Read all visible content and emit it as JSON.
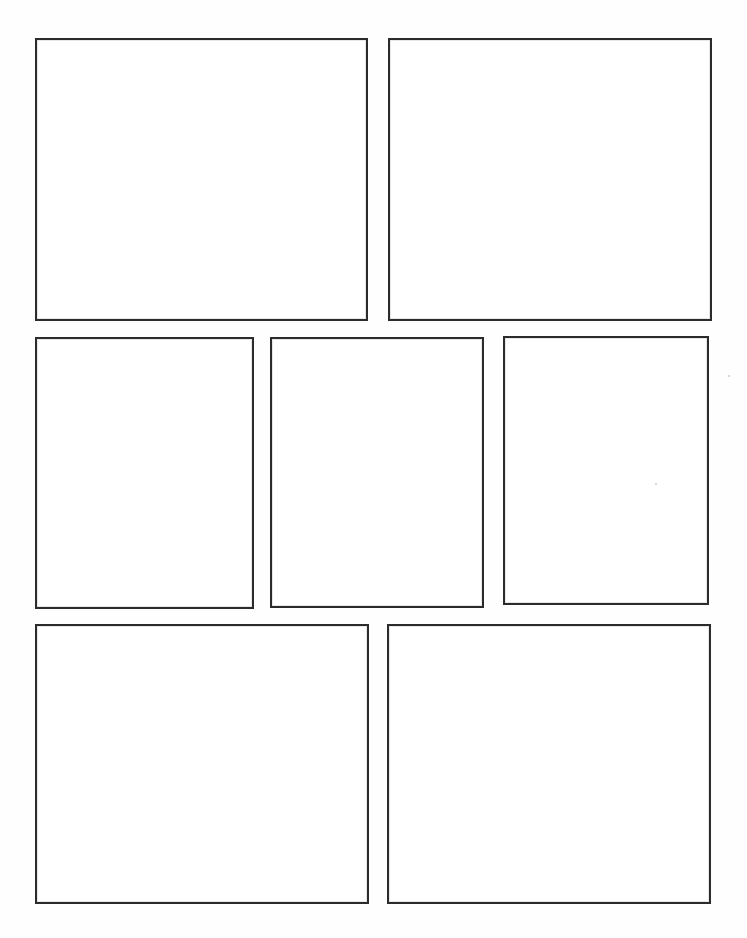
{
  "page": {
    "title": "Blank Panel Storyboard Template",
    "background_color": "#fefefe",
    "width": 747,
    "height": 938,
    "panel_fill_color": "#ffffff",
    "panel_border_color": "#2b2b2b",
    "panel_border_width_px": 2,
    "panel_count": 7,
    "row_count": 3
  },
  "rows": [
    {
      "name": "top-row",
      "index": 1,
      "panel_count": 2,
      "panels": [
        {
          "id": "panel-1",
          "label": "",
          "x": 35,
          "y": 38,
          "width": 333,
          "height": 283
        },
        {
          "id": "panel-2",
          "label": "",
          "x": 388,
          "y": 38,
          "width": 324,
          "height": 283
        }
      ]
    },
    {
      "name": "middle-row",
      "index": 2,
      "panel_count": 3,
      "panels": [
        {
          "id": "panel-3",
          "label": "",
          "x": 35,
          "y": 337,
          "width": 219,
          "height": 272
        },
        {
          "id": "panel-4",
          "label": "",
          "x": 270,
          "y": 337,
          "width": 214,
          "height": 271
        },
        {
          "id": "panel-5",
          "label": "",
          "x": 503,
          "y": 336,
          "width": 206,
          "height": 269
        }
      ]
    },
    {
      "name": "bottom-row",
      "index": 3,
      "panel_count": 2,
      "panels": [
        {
          "id": "panel-6",
          "label": "",
          "x": 35,
          "y": 624,
          "width": 334,
          "height": 280
        },
        {
          "id": "panel-7",
          "label": "",
          "x": 387,
          "y": 624,
          "width": 324,
          "height": 280
        }
      ]
    }
  ],
  "artifacts": {
    "specks": [
      {
        "x": 728,
        "y": 375,
        "size": 2
      },
      {
        "x": 655,
        "y": 483,
        "size": 2
      }
    ]
  }
}
